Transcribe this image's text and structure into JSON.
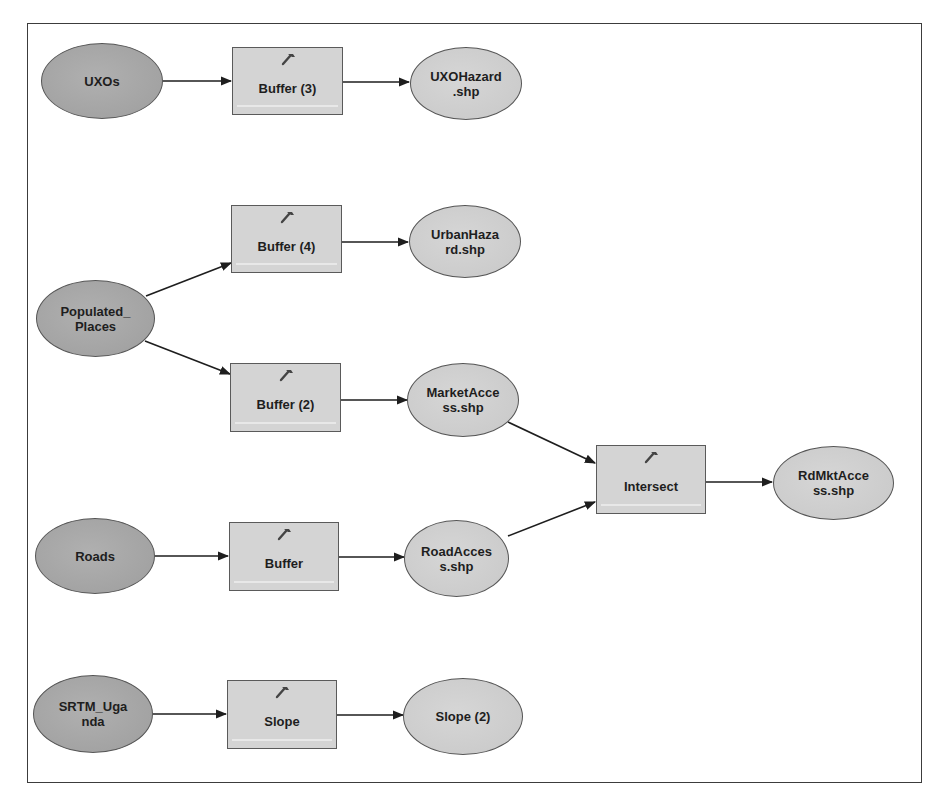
{
  "diagram": {
    "title": "",
    "colors": {
      "input_fill": "#a8a8a8",
      "output_fill": "#cfcfcf",
      "tool_fill": "#d4d4d4",
      "edge": "#1e1e1e",
      "frame": "#3c3c3c"
    },
    "nodes": {
      "uxos": {
        "type": "input-data",
        "label": "UXOs"
      },
      "buffer3": {
        "type": "tool",
        "label": "Buffer (3)",
        "icon": "hammer-icon"
      },
      "uxohazard": {
        "type": "output-data",
        "label": "UXOHazard\n.shp"
      },
      "populated_places": {
        "type": "input-data",
        "label": "Populated_\nPlaces"
      },
      "buffer4": {
        "type": "tool",
        "label": "Buffer (4)",
        "icon": "hammer-icon"
      },
      "urbanhazard": {
        "type": "output-data",
        "label": "UrbanHaza\nrd.shp"
      },
      "buffer2": {
        "type": "tool",
        "label": "Buffer (2)",
        "icon": "hammer-icon"
      },
      "marketaccess": {
        "type": "output-data",
        "label": "MarketAcce\nss.shp"
      },
      "intersect": {
        "type": "tool",
        "label": "Intersect",
        "icon": "hammer-icon"
      },
      "rdmktaccess": {
        "type": "output-data",
        "label": "RdMktAcce\nss.shp"
      },
      "roads": {
        "type": "input-data",
        "label": "Roads"
      },
      "buffer": {
        "type": "tool",
        "label": "Buffer",
        "icon": "hammer-icon"
      },
      "roadaccess": {
        "type": "output-data",
        "label": "RoadAcces\ns.shp"
      },
      "srtm_uganda": {
        "type": "input-data",
        "label": "SRTM_Uga\nnda"
      },
      "slope": {
        "type": "tool",
        "label": "Slope",
        "icon": "hammer-icon"
      },
      "slope2": {
        "type": "output-data",
        "label": "Slope (2)"
      }
    },
    "edges": [
      {
        "from": "UXOs",
        "to": "Buffer (3)"
      },
      {
        "from": "Buffer (3)",
        "to": "UXOHazard.shp"
      },
      {
        "from": "Populated_Places",
        "to": "Buffer (4)"
      },
      {
        "from": "Buffer (4)",
        "to": "UrbanHazard.shp"
      },
      {
        "from": "Populated_Places",
        "to": "Buffer (2)"
      },
      {
        "from": "Buffer (2)",
        "to": "MarketAccess.shp"
      },
      {
        "from": "MarketAccess.shp",
        "to": "Intersect"
      },
      {
        "from": "RoadAccess.shp",
        "to": "Intersect"
      },
      {
        "from": "Intersect",
        "to": "RdMktAccess.shp"
      },
      {
        "from": "Roads",
        "to": "Buffer"
      },
      {
        "from": "Buffer",
        "to": "RoadAccess.shp"
      },
      {
        "from": "SRTM_Uganda",
        "to": "Slope"
      },
      {
        "from": "Slope",
        "to": "Slope (2)"
      }
    ]
  }
}
